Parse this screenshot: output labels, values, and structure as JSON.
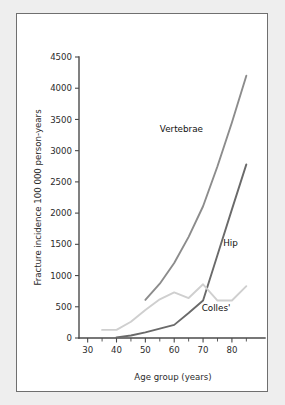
{
  "chart_data": {
    "type": "line",
    "title": "",
    "xlabel": "Age group (years)",
    "ylabel": "Fracture incidence 100 000 person-years",
    "xlim": [
      27,
      88
    ],
    "ylim": [
      0,
      4500
    ],
    "grid": false,
    "legend_position": "inline-annotations",
    "xticks": [
      30,
      40,
      50,
      60,
      70,
      80
    ],
    "xticks_minor": [
      35,
      45,
      55,
      65,
      75,
      85
    ],
    "yticks": [
      0,
      500,
      1000,
      1500,
      2000,
      2500,
      3000,
      3500,
      4000,
      4500
    ],
    "series": [
      {
        "name": "Vertebrae",
        "color": "#8c8c8c",
        "annotation": "Vertebrae",
        "x": [
          50,
          55,
          60,
          65,
          70,
          75,
          80,
          85
        ],
        "values": [
          610,
          870,
          1200,
          1620,
          2110,
          2750,
          3450,
          4200
        ]
      },
      {
        "name": "Hip",
        "color": "#6a6a6a",
        "annotation": "Hip",
        "x": [
          40,
          45,
          50,
          55,
          60,
          65,
          70,
          75,
          80,
          85
        ],
        "values": [
          10,
          40,
          90,
          150,
          210,
          400,
          600,
          1330,
          2060,
          2780
        ]
      },
      {
        "name": "Colles'",
        "color": "#cfcfcf",
        "annotation": "Colles'",
        "x": [
          35,
          40,
          45,
          50,
          55,
          60,
          65,
          70,
          75,
          80,
          85
        ],
        "values": [
          130,
          130,
          260,
          450,
          620,
          730,
          640,
          860,
          600,
          600,
          830
        ]
      }
    ],
    "annotations": [
      {
        "text": "Vertebrae",
        "x": 62.5,
        "y": 3300
      },
      {
        "text": "Hip",
        "x": 79.5,
        "y": 1480
      },
      {
        "text": "Colles'",
        "x": 74.5,
        "y": 430
      }
    ]
  },
  "figure": {
    "background_color": "#eeeeee",
    "panel_color": "#ffffff",
    "border_color": "#6f6f6f"
  }
}
